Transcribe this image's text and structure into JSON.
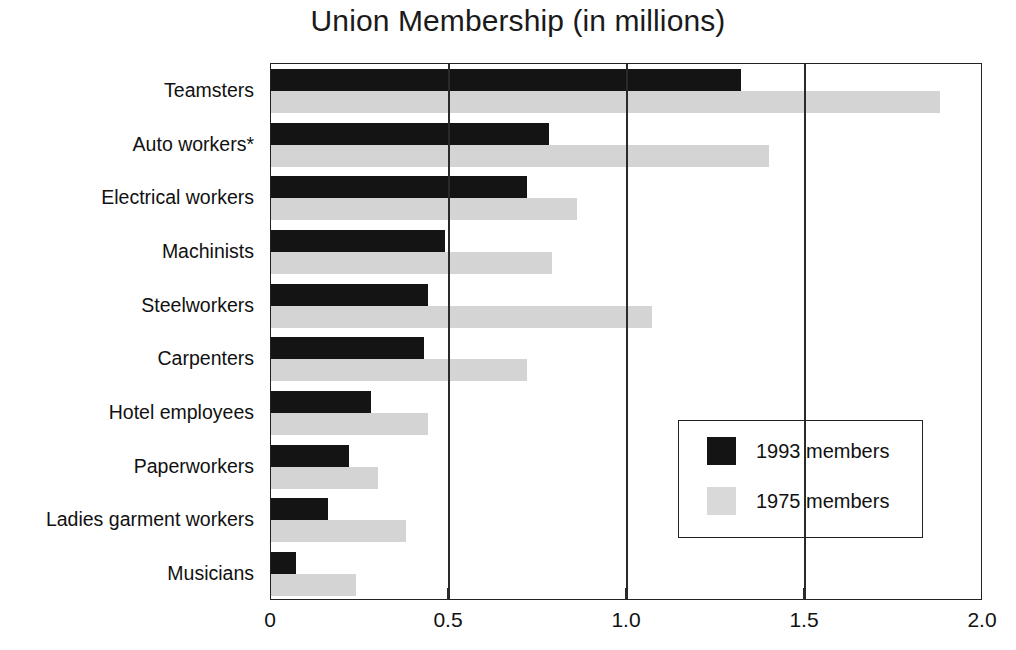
{
  "chart_data": {
    "type": "bar",
    "orientation": "horizontal",
    "title": "Union Membership (in millions)",
    "xlabel": "",
    "ylabel": "",
    "xlim": [
      0,
      2.0
    ],
    "xticks": [
      "0",
      "0.5",
      "1.0",
      "1.5",
      "2.0"
    ],
    "xtick_values": [
      0,
      0.5,
      1.0,
      1.5,
      2.0
    ],
    "grid": "vertical",
    "legend_position": "inside-right",
    "categories": [
      "Teamsters",
      "Auto workers*",
      "Electrical workers",
      "Machinists",
      "Steelworkers",
      "Carpenters",
      "Hotel employees",
      "Paperworkers",
      "Ladies garment workers",
      "Musicians"
    ],
    "series": [
      {
        "name": "1993 members",
        "color": "#141414",
        "values": [
          1.32,
          0.78,
          0.72,
          0.49,
          0.44,
          0.43,
          0.28,
          0.22,
          0.16,
          0.07
        ]
      },
      {
        "name": "1975 members",
        "color": "#d4d4d4",
        "values": [
          1.88,
          1.4,
          0.86,
          0.79,
          1.07,
          0.72,
          0.44,
          0.3,
          0.38,
          0.24
        ]
      }
    ]
  },
  "legend": {
    "entries": [
      {
        "label": "1993 members",
        "swatch": "dark-swatch"
      },
      {
        "label": "1975 members",
        "swatch": "light-swatch"
      }
    ]
  }
}
